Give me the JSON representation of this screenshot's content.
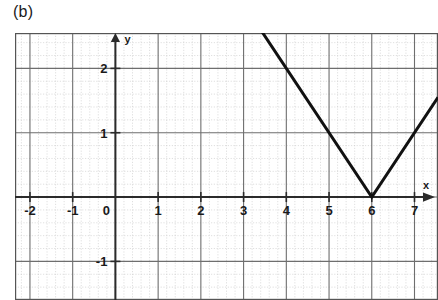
{
  "figure": {
    "panel_label": "(b)",
    "background_color": "#ffffff"
  },
  "chart_data": {
    "type": "line",
    "title": "",
    "subtitle": "",
    "xlabel": "x",
    "ylabel": "y",
    "xlim": [
      -2.35,
      7.55
    ],
    "ylim": [
      -1.6,
      2.55
    ],
    "grid": true,
    "grid_major_step": 1,
    "grid_minor_subdivisions": 5,
    "legend": false,
    "legend_position": "none",
    "axis_arrows": true,
    "x_ticks": [
      -2,
      -1,
      0,
      1,
      2,
      3,
      4,
      5,
      6,
      7
    ],
    "x_tick_labels": [
      "-2",
      "-1",
      "0",
      "1",
      "2",
      "3",
      "4",
      "5",
      "6",
      "7"
    ],
    "y_ticks": [
      -1,
      1,
      2
    ],
    "y_tick_labels": [
      "-1",
      "1",
      "2"
    ],
    "origin_label": "0",
    "series": [
      {
        "name": "v-shape",
        "description": "absolute value graph with vertex at (6, 0), slope -1 left branch, slope +1 right branch",
        "color": "#111111",
        "line_width": 3,
        "vertex": [
          6,
          0
        ],
        "points": [
          [
            3.43,
            2.57
          ],
          [
            6,
            0
          ],
          [
            7.55,
            1.55
          ]
        ]
      }
    ],
    "annotations": [],
    "colors": {
      "curve": "#111111",
      "axis": "#2b2b2b",
      "grid_major": "#6e6e6e",
      "grid_minor": "#c9c9c9",
      "text": "#1a1a1a",
      "border": "#555555"
    }
  }
}
